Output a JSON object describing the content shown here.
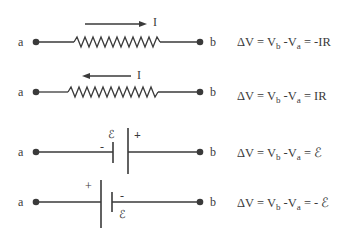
{
  "diagram": {
    "rows": [
      {
        "id": "resistor-current-right",
        "node_a": "a",
        "node_b": "b",
        "element": "resistor",
        "current_label": "I",
        "current_direction": "right",
        "equation": {
          "delta": "ΔV = V",
          "sub_b": "b",
          "mid": " -V",
          "sub_a": "a",
          "rhs": " = -IR"
        }
      },
      {
        "id": "resistor-current-left",
        "node_a": "a",
        "node_b": "b",
        "element": "resistor",
        "current_label": "I",
        "current_direction": "left",
        "equation": {
          "delta": "ΔV = V",
          "sub_b": "b",
          "mid": " -V",
          "sub_a": "a",
          "rhs": " = IR"
        }
      },
      {
        "id": "battery-minus-to-plus",
        "node_a": "a",
        "node_b": "b",
        "element": "battery",
        "emf_label": "ℰ",
        "plus_label": "+",
        "minus_label": "-",
        "equation": {
          "delta": "ΔV = V",
          "sub_b": "b",
          "mid": " -V",
          "sub_a": "a",
          "rhs": " = ℰ"
        }
      },
      {
        "id": "battery-plus-to-minus",
        "node_a": "a",
        "node_b": "b",
        "element": "battery",
        "emf_label": "ℰ",
        "plus_label": "+",
        "minus_label": "-",
        "equation": {
          "delta": "ΔV = V",
          "sub_b": "b",
          "mid": " -V",
          "sub_a": "a",
          "rhs": " = - ℰ"
        }
      }
    ],
    "colors": {
      "ink": "#3a3a3a",
      "background": "#ffffff"
    }
  }
}
